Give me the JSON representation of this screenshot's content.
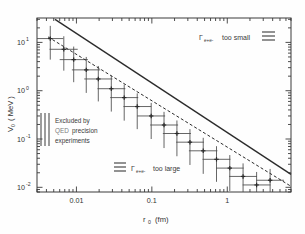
{
  "figure": {
    "background_color": "#fefefe",
    "frame_color": "#3a3a3a",
    "ink_color": "#2b2b2b"
  },
  "axes": {
    "x": {
      "title_symbol": "r",
      "title_sub": "0",
      "title_unit": "(fm)",
      "title_full": "r0  (fm)",
      "scale": "log",
      "lim": [
        0.003,
        7.0
      ],
      "tick_labels": [
        "0.01",
        "0.1",
        "1"
      ],
      "tick_values": [
        0.01,
        0.1,
        1
      ]
    },
    "y": {
      "title_symbol": "V",
      "title_sub": "0",
      "title_unit": "( MeV )",
      "title_full": "V0  ( MeV )",
      "scale": "log",
      "lim": [
        0.008,
        32.0
      ],
      "tick_labels": [
        "10",
        "10",
        "10",
        "10"
      ],
      "tick_exponents": [
        "1",
        "0",
        "-1",
        "-2"
      ],
      "tick_values": [
        10,
        1,
        0.1,
        0.01
      ]
    }
  },
  "annotations": {
    "too_small": {
      "symbol": "Γ",
      "subscript": "e+e-",
      "text": "too small",
      "swatch": "horizontal-hatch"
    },
    "too_large": {
      "symbol": "Γ",
      "subscript": "e+e-",
      "text": "too large",
      "swatch": "horizontal-hatch"
    },
    "excluded": {
      "line1": "Excluded by",
      "line2a": "QED",
      "line2b": "precision",
      "line3": "experiments",
      "swatch": "vertical-hatch"
    }
  },
  "chart_data": {
    "type": "scatter",
    "title": "",
    "xlabel": "r0  (fm)",
    "ylabel": "V0  ( MeV )",
    "xscale": "log",
    "yscale": "log",
    "xlim": [
      0.003,
      7.0
    ],
    "ylim": [
      0.008,
      32.0
    ],
    "grid": false,
    "legend_position": "none",
    "series": [
      {
        "name": "upper-bound-solid",
        "type": "line",
        "style": "solid",
        "x": [
          0.0052,
          7.0
        ],
        "y": [
          30.0,
          0.0185
        ]
      },
      {
        "name": "lower-bound-dashed",
        "type": "line",
        "style": "dashed",
        "x": [
          0.0042,
          7.0
        ],
        "y": [
          13.0,
          0.0105
        ]
      },
      {
        "name": "data-points",
        "type": "scatter_with_errorbars",
        "marker": "plus",
        "points": [
          {
            "x": 0.0045,
            "y": 12.0,
            "xerr_lo": 0.0016,
            "xerr_hi": 0.0022,
            "yerr_lo": 7.6,
            "yerr_hi": 10.0
          },
          {
            "x": 0.0068,
            "y": 7.2,
            "xerr_lo": 0.0024,
            "xerr_hi": 0.0036,
            "yerr_lo": 4.6,
            "yerr_hi": 6.2
          },
          {
            "x": 0.0092,
            "y": 4.4,
            "xerr_lo": 0.0032,
            "xerr_hi": 0.005,
            "yerr_lo": 2.9,
            "yerr_hi": 3.8
          },
          {
            "x": 0.0135,
            "y": 2.7,
            "xerr_lo": 0.0048,
            "xerr_hi": 0.0072,
            "yerr_lo": 1.8,
            "yerr_hi": 2.3
          },
          {
            "x": 0.0195,
            "y": 1.75,
            "xerr_lo": 0.0068,
            "xerr_hi": 0.0105,
            "yerr_lo": 1.15,
            "yerr_hi": 1.5
          },
          {
            "x": 0.029,
            "y": 1.1,
            "xerr_lo": 0.01,
            "xerr_hi": 0.0155,
            "yerr_lo": 0.73,
            "yerr_hi": 0.95
          },
          {
            "x": 0.043,
            "y": 0.72,
            "xerr_lo": 0.015,
            "xerr_hi": 0.023,
            "yerr_lo": 0.48,
            "yerr_hi": 0.62
          },
          {
            "x": 0.064,
            "y": 0.47,
            "xerr_lo": 0.022,
            "xerr_hi": 0.034,
            "yerr_lo": 0.31,
            "yerr_hi": 0.41
          },
          {
            "x": 0.098,
            "y": 0.3,
            "xerr_lo": 0.034,
            "xerr_hi": 0.052,
            "yerr_lo": 0.2,
            "yerr_hi": 0.26
          },
          {
            "x": 0.145,
            "y": 0.195,
            "xerr_lo": 0.05,
            "xerr_hi": 0.078,
            "yerr_lo": 0.13,
            "yerr_hi": 0.17
          },
          {
            "x": 0.215,
            "y": 0.13,
            "xerr_lo": 0.075,
            "xerr_hi": 0.115,
            "yerr_lo": 0.086,
            "yerr_hi": 0.112
          },
          {
            "x": 0.32,
            "y": 0.086,
            "xerr_lo": 0.11,
            "xerr_hi": 0.17,
            "yerr_lo": 0.057,
            "yerr_hi": 0.074
          },
          {
            "x": 0.48,
            "y": 0.057,
            "xerr_lo": 0.17,
            "xerr_hi": 0.26,
            "yerr_lo": 0.038,
            "yerr_hi": 0.049
          },
          {
            "x": 0.72,
            "y": 0.038,
            "xerr_lo": 0.25,
            "xerr_hi": 0.38,
            "yerr_lo": 0.025,
            "yerr_hi": 0.033
          },
          {
            "x": 1.08,
            "y": 0.025,
            "xerr_lo": 0.37,
            "xerr_hi": 0.57,
            "yerr_lo": 0.0166,
            "yerr_hi": 0.0215
          },
          {
            "x": 1.62,
            "y": 0.0168,
            "xerr_lo": 0.56,
            "xerr_hi": 0.86,
            "yerr_lo": 0.0111,
            "yerr_hi": 0.0145
          },
          {
            "x": 2.45,
            "y": 0.0112,
            "xerr_lo": 0.85,
            "xerr_hi": 1.3,
            "yerr_lo": 0.0074,
            "yerr_hi": 0.0096
          },
          {
            "x": 3.7,
            "y": 0.014,
            "xerr_lo": 1.28,
            "xerr_hi": 1.95,
            "yerr_lo": 0.006,
            "yerr_hi": 0.01
          }
        ]
      }
    ]
  }
}
